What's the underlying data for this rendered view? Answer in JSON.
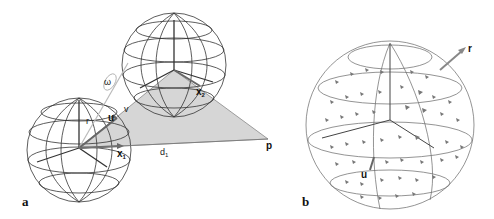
{
  "figure": {
    "panels": [
      {
        "id": "a",
        "label": "a",
        "description": "Two wireframe spheres with shaded triangle to point p",
        "labels": {
          "r": "r",
          "u": "u",
          "v": "v",
          "omega": "ω",
          "x1": "x",
          "x1_sub": "1",
          "x2": "x",
          "x2_sub": "2",
          "d1": "d",
          "d1_sub": "1",
          "p": "p"
        }
      },
      {
        "id": "b",
        "label": "b",
        "description": "Wireframe sphere with vector field arrows",
        "labels": {
          "r": "r",
          "u": "u"
        }
      }
    ],
    "colors": {
      "wire": "#333333",
      "wire_light": "#777777",
      "shade": "#d4d4d4",
      "vector": "#888888",
      "arrow": "#666666"
    }
  }
}
